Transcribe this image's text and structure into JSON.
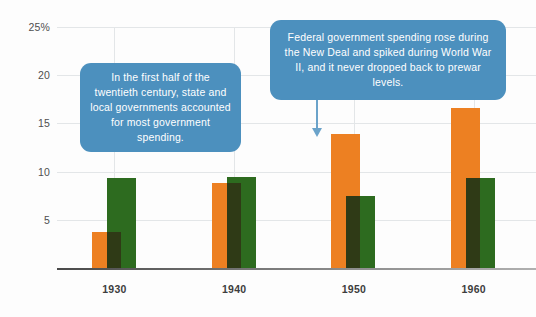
{
  "chart_data": {
    "type": "bar",
    "title": "",
    "subtitle": "",
    "xlabel": "",
    "ylabel": "",
    "categories": [
      "1930",
      "1940",
      "1950",
      "1960"
    ],
    "ylim": [
      0,
      25
    ],
    "yticks": [
      5,
      10,
      15,
      20,
      25
    ],
    "ytick_labels": [
      "5",
      "10",
      "15",
      "20",
      "25%"
    ],
    "grid": true,
    "legend": "none",
    "series": [
      {
        "name": "Federal government spending",
        "color": "#ed8022",
        "values": [
          3.7,
          8.8,
          13.9,
          16.6
        ]
      },
      {
        "name": "State and local government spending",
        "color": "#2d6b1f",
        "values": [
          9.3,
          9.4,
          7.5,
          9.3
        ]
      }
    ],
    "annotations": [
      {
        "id": "state-local",
        "text": "In the first half of the twentieth century, state and local governments accounted for most government spending.",
        "color": "#4c90be"
      },
      {
        "id": "federal",
        "text": "Federal government spending rose during the New Deal and spiked during World War II, and it never dropped back to prewar levels.",
        "color": "#4c90be",
        "points_to": "1950"
      }
    ]
  },
  "axis": {
    "y": {
      "ticks": [
        {
          "label": "25%",
          "value": 25
        },
        {
          "label": "20",
          "value": 20
        },
        {
          "label": "15",
          "value": 15
        },
        {
          "label": "10",
          "value": 10
        },
        {
          "label": "5",
          "value": 5
        }
      ]
    },
    "x": {
      "ticks": [
        {
          "label": "1930"
        },
        {
          "label": "1940"
        },
        {
          "label": "1950"
        },
        {
          "label": "1960"
        }
      ]
    }
  },
  "callouts": {
    "state_local": "In the first half of the twentieth century, state and local governments accounted for most government spending.",
    "federal": "Federal government spending rose during the New Deal and spiked during World War II, and it never dropped back to prewar levels."
  }
}
